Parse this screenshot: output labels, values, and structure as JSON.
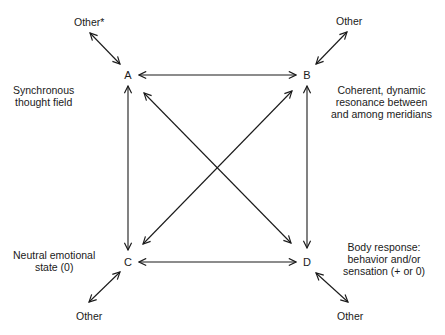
{
  "diagram": {
    "nodes": {
      "A": {
        "label": "A",
        "x": 128,
        "y": 75
      },
      "B": {
        "label": "B",
        "x": 307,
        "y": 75
      },
      "C": {
        "label": "C",
        "x": 128,
        "y": 262
      },
      "D": {
        "label": "D",
        "x": 307,
        "y": 262
      }
    },
    "descriptions": {
      "A": [
        "Synchronous",
        "thought field"
      ],
      "B": [
        "Coherent, dynamic",
        "resonance between",
        "and among meridians"
      ],
      "C": [
        "Neutral emotional",
        "state (0)"
      ],
      "D": [
        "Body response:",
        "behavior and/or",
        "sensation (+ or 0)"
      ]
    },
    "other_labels": {
      "A": "Other*",
      "B": "Other",
      "C": "Other",
      "D": "Other"
    },
    "edges": [
      {
        "from": "A",
        "to": "B",
        "type": "bidirectional"
      },
      {
        "from": "C",
        "to": "D",
        "type": "bidirectional"
      },
      {
        "from": "A",
        "to": "C",
        "type": "bidirectional"
      },
      {
        "from": "B",
        "to": "D",
        "type": "bidirectional"
      },
      {
        "from": "A",
        "to": "D",
        "type": "bidirectional"
      },
      {
        "from": "B",
        "to": "C",
        "type": "bidirectional"
      },
      {
        "from": "A",
        "to": "Other*",
        "type": "bidirectional"
      },
      {
        "from": "B",
        "to": "Other",
        "type": "bidirectional"
      },
      {
        "from": "C",
        "to": "Other",
        "type": "bidirectional"
      },
      {
        "from": "D",
        "to": "Other",
        "type": "bidirectional"
      }
    ],
    "colors": {
      "line": "#1a1a1a",
      "background": "#ffffff"
    }
  }
}
